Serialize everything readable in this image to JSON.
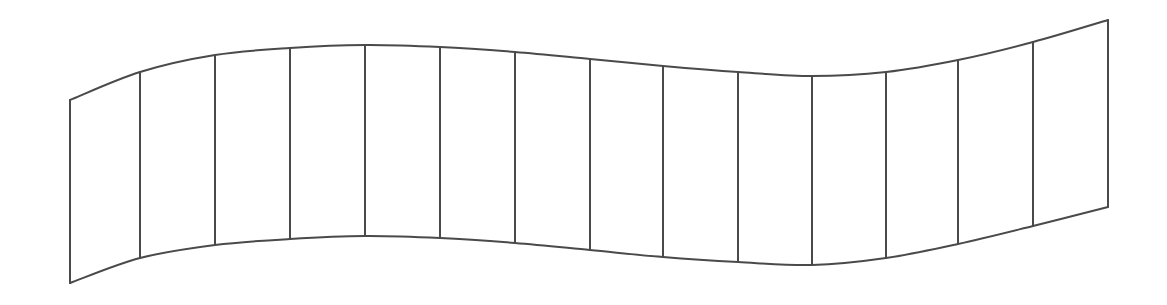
{
  "figure": {
    "title": "Curved ribbon strip with segment dividers",
    "type": "line-diagram",
    "canvas": {
      "width": 1167,
      "height": 305,
      "background_color": "#ffffff"
    },
    "style": {
      "stroke_color": "#4a4a4a",
      "stroke_width": 2,
      "fill_color": "#ffffff"
    }
  },
  "chart_data": {
    "type": "line",
    "title": "Curved ribbon strip with segment dividers",
    "subtitle": "",
    "xlabel": "",
    "ylabel": "",
    "xlim": [
      0,
      1167
    ],
    "ylim": [
      0,
      305
    ],
    "grid": false,
    "legend": "none",
    "annotations": [],
    "tick_labels": {
      "x": [],
      "y": []
    },
    "series": [
      {
        "name": "top-edge",
        "points": [
          [
            70,
            100
          ],
          [
            140,
            72
          ],
          [
            215,
            55
          ],
          [
            290,
            48
          ],
          [
            365,
            45
          ],
          [
            440,
            47
          ],
          [
            515,
            52
          ],
          [
            590,
            59
          ],
          [
            663,
            66
          ],
          [
            738,
            72
          ],
          [
            812,
            76
          ],
          [
            886,
            72
          ],
          [
            958,
            60
          ],
          [
            1033,
            42
          ],
          [
            1108,
            20
          ]
        ]
      },
      {
        "name": "bottom-edge",
        "points": [
          [
            70,
            283
          ],
          [
            140,
            258
          ],
          [
            215,
            245
          ],
          [
            290,
            239
          ],
          [
            365,
            236
          ],
          [
            440,
            238
          ],
          [
            515,
            243
          ],
          [
            590,
            250
          ],
          [
            663,
            257
          ],
          [
            738,
            262
          ],
          [
            812,
            265
          ],
          [
            886,
            258
          ],
          [
            958,
            244
          ],
          [
            1033,
            226
          ],
          [
            1108,
            207
          ]
        ]
      }
    ],
    "ribs": [
      {
        "index": 1,
        "x_top": 70,
        "y_top": 100,
        "x_bottom": 70,
        "y_bottom": 283
      },
      {
        "index": 2,
        "x_top": 140,
        "y_top": 72,
        "x_bottom": 140,
        "y_bottom": 258
      },
      {
        "index": 3,
        "x_top": 215,
        "y_top": 55,
        "x_bottom": 215,
        "y_bottom": 245
      },
      {
        "index": 4,
        "x_top": 290,
        "y_top": 48,
        "x_bottom": 290,
        "y_bottom": 239
      },
      {
        "index": 5,
        "x_top": 365,
        "y_top": 45,
        "x_bottom": 365,
        "y_bottom": 236
      },
      {
        "index": 6,
        "x_top": 440,
        "y_top": 47,
        "x_bottom": 440,
        "y_bottom": 238
      },
      {
        "index": 7,
        "x_top": 515,
        "y_top": 52,
        "x_bottom": 515,
        "y_bottom": 243
      },
      {
        "index": 8,
        "x_top": 590,
        "y_top": 59,
        "x_bottom": 590,
        "y_bottom": 250
      },
      {
        "index": 9,
        "x_top": 663,
        "y_top": 66,
        "x_bottom": 663,
        "y_bottom": 257
      },
      {
        "index": 10,
        "x_top": 738,
        "y_top": 72,
        "x_bottom": 738,
        "y_bottom": 262
      },
      {
        "index": 11,
        "x_top": 812,
        "y_top": 76,
        "x_bottom": 812,
        "y_bottom": 265
      },
      {
        "index": 12,
        "x_top": 886,
        "y_top": 72,
        "x_bottom": 886,
        "y_bottom": 258
      },
      {
        "index": 13,
        "x_top": 958,
        "y_top": 60,
        "x_bottom": 958,
        "y_bottom": 244
      },
      {
        "index": 14,
        "x_top": 1033,
        "y_top": 42,
        "x_bottom": 1033,
        "y_bottom": 226
      },
      {
        "index": 15,
        "x_top": 1108,
        "y_top": 20,
        "x_bottom": 1108,
        "y_bottom": 207
      }
    ],
    "counts": {
      "rib_count": 15,
      "panel_count": 14
    }
  }
}
